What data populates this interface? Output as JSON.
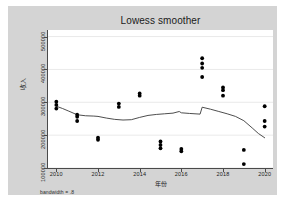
{
  "chart_data": {
    "type": "scatter",
    "title": "Lowess smoother",
    "xlabel": "年份",
    "ylabel": "收入",
    "footnote": "bandwidth = .8",
    "xlim": [
      2009.6,
      2020.4
    ],
    "ylim": [
      100000,
      520000
    ],
    "xticks": [
      2010,
      2012,
      2014,
      2016,
      2018,
      2020
    ],
    "xticklabels": [
      "2010",
      "2012",
      "2014",
      "2016",
      "2018",
      "2020"
    ],
    "yticks": [
      100000,
      200000,
      300000,
      400000,
      500000
    ],
    "yticklabels": [
      "100000",
      "200000",
      "300000",
      "400000",
      "500000"
    ],
    "grid": "horizontal",
    "legend": "none",
    "marker_color": "#000000",
    "line_color": "#3a3a3a",
    "plot_bgcolor": "#ffffff",
    "graph_bgcolor": "#d4d4d4",
    "series": [
      {
        "name": "收入",
        "type": "scatter",
        "points": [
          {
            "x": 2010,
            "y": 302000
          },
          {
            "x": 2010,
            "y": 292000
          },
          {
            "x": 2010,
            "y": 281000
          },
          {
            "x": 2011,
            "y": 262000
          },
          {
            "x": 2011,
            "y": 256000
          },
          {
            "x": 2011,
            "y": 243000
          },
          {
            "x": 2012,
            "y": 192000
          },
          {
            "x": 2012,
            "y": 186000
          },
          {
            "x": 2013,
            "y": 296000
          },
          {
            "x": 2013,
            "y": 286000
          },
          {
            "x": 2014,
            "y": 327000
          },
          {
            "x": 2014,
            "y": 320000
          },
          {
            "x": 2015,
            "y": 181000
          },
          {
            "x": 2015,
            "y": 170000
          },
          {
            "x": 2015,
            "y": 160000
          },
          {
            "x": 2016,
            "y": 158000
          },
          {
            "x": 2016,
            "y": 151000
          },
          {
            "x": 2017,
            "y": 434000
          },
          {
            "x": 2017,
            "y": 418000
          },
          {
            "x": 2017,
            "y": 405000
          },
          {
            "x": 2017,
            "y": 377000
          },
          {
            "x": 2018,
            "y": 345000
          },
          {
            "x": 2018,
            "y": 337000
          },
          {
            "x": 2018,
            "y": 320000
          },
          {
            "x": 2019,
            "y": 155000
          },
          {
            "x": 2019,
            "y": 112000
          },
          {
            "x": 2020,
            "y": 288000
          },
          {
            "x": 2020,
            "y": 243000
          },
          {
            "x": 2020,
            "y": 226000
          }
        ]
      },
      {
        "name": "lowess",
        "type": "line",
        "points": [
          {
            "x": 2010.0,
            "y": 288000
          },
          {
            "x": 2010.3,
            "y": 281000
          },
          {
            "x": 2010.6,
            "y": 273000
          },
          {
            "x": 2011.0,
            "y": 262000
          },
          {
            "x": 2011.4,
            "y": 259000
          },
          {
            "x": 2011.8,
            "y": 258000
          },
          {
            "x": 2012.0,
            "y": 257000
          },
          {
            "x": 2012.4,
            "y": 252000
          },
          {
            "x": 2012.8,
            "y": 248000
          },
          {
            "x": 2013.2,
            "y": 246000
          },
          {
            "x": 2013.6,
            "y": 247000
          },
          {
            "x": 2014.0,
            "y": 254000
          },
          {
            "x": 2014.4,
            "y": 260000
          },
          {
            "x": 2014.8,
            "y": 263000
          },
          {
            "x": 2015.2,
            "y": 265000
          },
          {
            "x": 2015.6,
            "y": 267000
          },
          {
            "x": 2015.9,
            "y": 272000
          },
          {
            "x": 2016.0,
            "y": 268000
          },
          {
            "x": 2016.4,
            "y": 266000
          },
          {
            "x": 2016.9,
            "y": 264000
          },
          {
            "x": 2017.0,
            "y": 285000
          },
          {
            "x": 2017.4,
            "y": 279000
          },
          {
            "x": 2017.8,
            "y": 272000
          },
          {
            "x": 2018.2,
            "y": 265000
          },
          {
            "x": 2018.6,
            "y": 257000
          },
          {
            "x": 2019.0,
            "y": 244000
          },
          {
            "x": 2019.4,
            "y": 222000
          },
          {
            "x": 2019.7,
            "y": 205000
          },
          {
            "x": 2020.0,
            "y": 192000
          }
        ]
      }
    ]
  }
}
